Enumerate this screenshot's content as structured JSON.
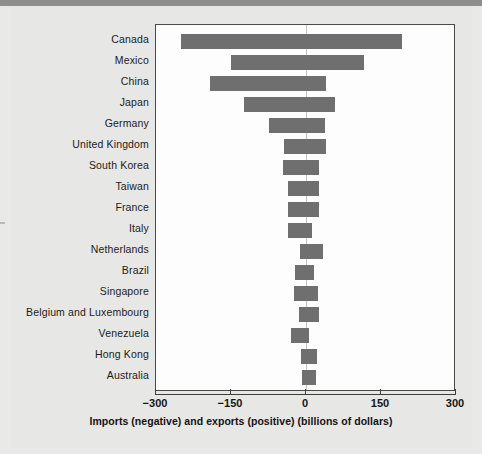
{
  "figure": {
    "x_axis_title": "Imports (negative) and exports (positive) (billions of dollars)",
    "colors": {
      "bar": "#6f6f6f",
      "frame": "#4a4a4a",
      "zero_line": "#c3c3c3",
      "page_background": "#e7e7e5",
      "plot_background": "#fdfdfd"
    }
  },
  "chart_data": {
    "type": "bar",
    "orientation": "horizontal",
    "title": "",
    "xlabel": "Imports (negative) and exports (positive) (billions of dollars)",
    "ylabel": "",
    "xlim": [
      -300,
      300
    ],
    "xticks": [
      -300,
      -150,
      0,
      150,
      300
    ],
    "xtick_labels": [
      "−300",
      "−150",
      "0",
      "150",
      "300"
    ],
    "grid": false,
    "legend": false,
    "zero_reference_line": true,
    "categories": [
      "Canada",
      "Mexico",
      "China",
      "Japan",
      "Germany",
      "United Kingdom",
      "South Korea",
      "Taiwan",
      "France",
      "Italy",
      "Netherlands",
      "Brazil",
      "Singapore",
      "Belgium and Luxembourg",
      "Venezuela",
      "Hong Kong",
      "Australia"
    ],
    "series": [
      {
        "name": "Imports (negative)",
        "values": [
          -250,
          -150,
          -192,
          -125,
          -75,
          -44,
          -46,
          -36,
          -36,
          -36,
          -12,
          -22,
          -24,
          -14,
          -30,
          -10,
          -8
        ]
      },
      {
        "name": "Exports (positive)",
        "values": [
          192,
          115,
          40,
          58,
          38,
          40,
          26,
          26,
          26,
          12,
          34,
          16,
          24,
          26,
          6,
          22,
          20
        ]
      }
    ]
  }
}
